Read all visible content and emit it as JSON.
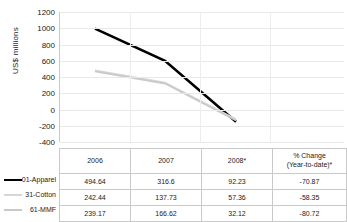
{
  "chart_data": {
    "type": "line",
    "title": "",
    "xlabel": "",
    "ylabel": "US$ millions",
    "categories": [
      "2006",
      "2007",
      "2008*"
    ],
    "ylim": [
      -400,
      1200
    ],
    "yticks": [
      1200,
      1000,
      800,
      600,
      400,
      200,
      0,
      -200,
      -400
    ],
    "grid": true,
    "legend_position": "left-of-table",
    "series": [
      {
        "name": "01-Apparel",
        "color": "#000000",
        "values": [
          995,
          600,
          -150
        ]
      },
      {
        "name": "31-Cotton",
        "color": "#d6d6d6",
        "values": [
          480,
          330,
          -120
        ]
      },
      {
        "name": "61-MMF",
        "color": "#c9c9c9",
        "values": [
          468,
          320,
          -135
        ]
      }
    ]
  },
  "table": {
    "headers": [
      "",
      "2006",
      "2007",
      "2008*",
      "% Change (Year-to-date)*"
    ],
    "header_change_line1": "% Change",
    "header_change_line2": "(Year-to-date)*",
    "rows": [
      {
        "label": "01-Apparel",
        "v2006": "494.64",
        "v2007": "316.6",
        "v2008": "92.23",
        "change": "-70.87"
      },
      {
        "label": "31-Cotton",
        "v2006": "242.44",
        "v2007": "137.73",
        "v2008": "57.36",
        "change": "-58.35"
      },
      {
        "label": "61-MMF",
        "v2006": "239.17",
        "v2007": "166.62",
        "v2008": "32.12",
        "change": "-80.72"
      }
    ]
  }
}
